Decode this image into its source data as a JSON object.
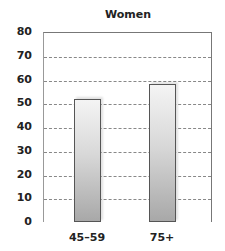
{
  "chart_data": {
    "type": "bar",
    "title": "Women",
    "categories": [
      "45–59",
      "75+"
    ],
    "values": [
      52,
      58
    ],
    "xlabel": "",
    "ylabel": "",
    "ylim": [
      0,
      80
    ],
    "yticks": [
      "0",
      "10",
      "20",
      "30",
      "40",
      "50",
      "60",
      "70",
      "80"
    ],
    "grid": true,
    "legend": null,
    "bar_color": "#c8c8c8"
  }
}
